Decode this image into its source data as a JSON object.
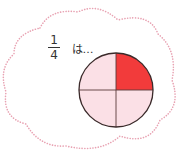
{
  "prompt": {
    "numerator": "1",
    "denominator": "4",
    "suffix": "は…"
  },
  "colors": {
    "cloud_outline": "#e8a2b2",
    "shaded_quarter": "#f23b3b",
    "unshaded_quarter": "#fbe0e6",
    "circle_stroke": "#5a3a3a"
  },
  "circle": {
    "parts": 4,
    "shaded_parts": 1,
    "shaded_position": "top-right"
  }
}
